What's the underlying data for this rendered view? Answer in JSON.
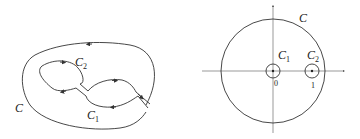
{
  "left_figure": {
    "outer_contour": {
      "label": "C",
      "label_pos": [
        15,
        112
      ]
    },
    "inner_contours": [
      {
        "label": "C",
        "subscript": "2",
        "label_pos": [
          75,
          66
        ]
      },
      {
        "label": "C",
        "subscript": "1",
        "label_pos": [
          87,
          119
        ]
      }
    ]
  },
  "right_figure": {
    "big_circle": {
      "label": "C",
      "center": [
        93,
        71
      ],
      "radius": 52
    },
    "small_circles": [
      {
        "label": "C",
        "subscript": "1",
        "center": [
          93,
          71
        ],
        "radius": 7,
        "tick": "0"
      },
      {
        "label": "C",
        "subscript": "2",
        "center": [
          132,
          71
        ],
        "radius": 7,
        "tick": "1"
      }
    ]
  },
  "colors": {
    "stroke": "#333333",
    "axis": "#555555",
    "background": "#ffffff"
  }
}
